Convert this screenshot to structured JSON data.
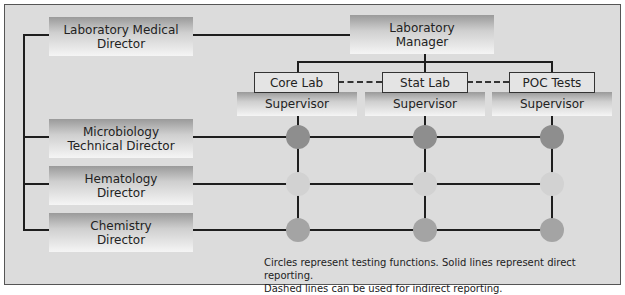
{
  "diagram": {
    "type": "org-chart",
    "directors": [
      {
        "id": "lab-medical-director",
        "label": "Laboratory Medical Director",
        "lines": [
          "Laboratory Medical",
          "Director"
        ]
      },
      {
        "id": "microbiology",
        "label": "Microbiology Technical Director",
        "lines": [
          "Microbiology",
          "Technical Director"
        ]
      },
      {
        "id": "hematology",
        "label": "Hematology Director",
        "lines": [
          "Hematology",
          "Director"
        ]
      },
      {
        "id": "chemistry",
        "label": "Chemistry Director",
        "lines": [
          "Chemistry",
          "Director"
        ]
      }
    ],
    "manager": {
      "label": "Laboratory Manager",
      "lines": [
        "Laboratory",
        "Manager"
      ]
    },
    "sections": [
      {
        "label": "Core Lab",
        "supervisor": "Supervisor"
      },
      {
        "label": "Stat Lab",
        "supervisor": "Supervisor"
      },
      {
        "label": "POC Tests",
        "supervisor": "Supervisor"
      }
    ],
    "circle_colors": {
      "microbiology": "#8e8e8e",
      "hematology": "#d2d2d2",
      "chemistry": "#a4a4a4"
    },
    "caption": {
      "line1": "Circles represent testing functions. Solid lines represent direct reporting.",
      "line2": "Dashed lines can be used for indirect reporting."
    }
  }
}
